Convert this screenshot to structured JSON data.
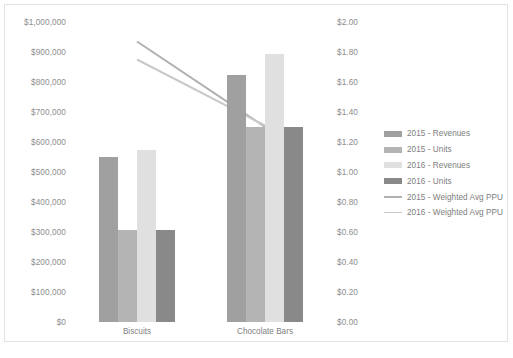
{
  "chart_data": {
    "type": "bar",
    "title": "",
    "subtitle": "",
    "xlabel": "",
    "ylabel": "",
    "y2label": "",
    "grid": false,
    "legend_position": "right",
    "categories": [
      "Biscuits",
      "Chocolate Bars"
    ],
    "primary_axis": {
      "min": 0,
      "max": 1000000,
      "step": 100000,
      "ticks": [
        "$0",
        "$100,000",
        "$200,000",
        "$300,000",
        "$400,000",
        "$500,000",
        "$600,000",
        "$700,000",
        "$800,000",
        "$900,000",
        "$1,000,000"
      ]
    },
    "secondary_axis": {
      "min": 0,
      "max": 2.0,
      "step": 0.2,
      "ticks": [
        "$0.00",
        "$0.20",
        "$0.40",
        "$0.60",
        "$0.80",
        "$1.00",
        "$1.20",
        "$1.40",
        "$1.60",
        "$1.80",
        "$2.00"
      ]
    },
    "series": [
      {
        "name": "2015 - Revenues",
        "kind": "bar",
        "axis": "primary",
        "color": "#a0a0a0",
        "values": [
          550000,
          825000
        ]
      },
      {
        "name": "2015 - Units",
        "kind": "bar",
        "axis": "primary",
        "color": "#b4b4b4",
        "values": [
          307000,
          650000
        ]
      },
      {
        "name": "2016 - Revenues",
        "kind": "bar",
        "axis": "primary",
        "color": "#e0e0e0",
        "values": [
          575000,
          895000
        ]
      },
      {
        "name": "2016 - Units",
        "kind": "bar",
        "axis": "primary",
        "color": "#898989",
        "values": [
          307000,
          650000
        ]
      },
      {
        "name": "2015 - Weighted Avg PPU",
        "kind": "line",
        "axis": "secondary",
        "color": "#b0b0b0",
        "values": [
          1.87,
          1.3
        ]
      },
      {
        "name": "2016 - Weighted Avg PPU",
        "kind": "line",
        "axis": "secondary",
        "color": "#c9c9c9",
        "values": [
          1.75,
          1.31
        ]
      }
    ]
  },
  "legend": {
    "items": [
      {
        "label": "2015 - Revenues",
        "swatch": "bar",
        "color": "#a0a0a0"
      },
      {
        "label": "2015 - Units",
        "swatch": "bar",
        "color": "#b4b4b4"
      },
      {
        "label": "2016 - Revenues",
        "swatch": "bar",
        "color": "#e0e0e0"
      },
      {
        "label": "2016 - Units",
        "swatch": "bar",
        "color": "#898989"
      },
      {
        "label": "2015 - Weighted Avg PPU",
        "swatch": "line",
        "color": "#b0b0b0"
      },
      {
        "label": "2016 - Weighted Avg PPU",
        "swatch": "line",
        "color": "#c9c9c9"
      }
    ]
  }
}
